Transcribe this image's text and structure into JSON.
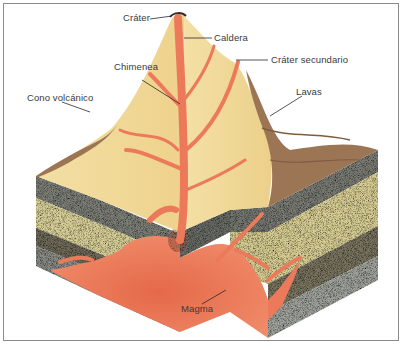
{
  "diagram": {
    "labels": {
      "crater": "Cráter",
      "caldera": "Caldera",
      "chimney": "Chimenea",
      "secondary_crater": "Cráter secundario",
      "volcanic_cone": "Cono volcánico",
      "lavas": "Lavas",
      "magma": "Magma"
    },
    "colors": {
      "cone": "#f2dc9a",
      "cone_shadow": "#e8c97e",
      "lava_flow": "#9c7654",
      "magma": "#ec7a5a",
      "magma_core": "#e96a4c",
      "rock_gray": "#7c7e76",
      "rock_sand": "#d8cf98",
      "rock_dark": "#6f6a58",
      "frame_border": "#8a8a8a",
      "label_text": "#3a3a3a"
    }
  }
}
